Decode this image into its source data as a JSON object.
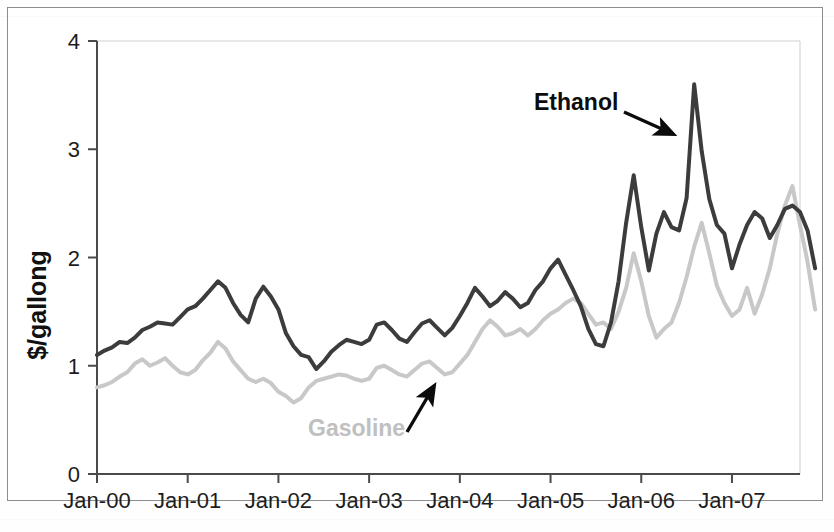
{
  "figure": {
    "background_color": "#ffffff",
    "border_color": "#8d8d8d"
  },
  "chart_data": {
    "type": "line",
    "title": "",
    "subtitle": "",
    "xlabel": "",
    "ylabel": "$/gallong",
    "xlim": [
      0,
      93
    ],
    "ylim": [
      0,
      4
    ],
    "grid": false,
    "legend_position": "inline-annotations",
    "x_tick_labels": [
      "Jan-00",
      "Jan-01",
      "Jan-02",
      "Jan-03",
      "Jan-04",
      "Jan-05",
      "Jan-06",
      "Jan-07"
    ],
    "x_tick_positions": [
      0,
      12,
      24,
      36,
      48,
      60,
      72,
      84
    ],
    "y_tick_labels": [
      "0",
      "1",
      "2",
      "3",
      "4"
    ],
    "y_tick_values": [
      0,
      1,
      2,
      3,
      4
    ],
    "annotations": [
      {
        "text": "Ethanol",
        "color": "#0c0c0c",
        "arrow": true,
        "arrow_direction": "down-right"
      },
      {
        "text": "Gasoline",
        "color": "#c0c0c0",
        "arrow": true,
        "arrow_direction": "up-right"
      }
    ],
    "series": [
      {
        "name": "Ethanol",
        "color": "#3c3c3c",
        "line_width": 4.0,
        "values": [
          1.1,
          1.14,
          1.17,
          1.22,
          1.21,
          1.26,
          1.33,
          1.36,
          1.4,
          1.39,
          1.38,
          1.45,
          1.52,
          1.55,
          1.62,
          1.7,
          1.78,
          1.72,
          1.58,
          1.47,
          1.4,
          1.62,
          1.73,
          1.64,
          1.52,
          1.3,
          1.18,
          1.1,
          1.08,
          0.97,
          1.04,
          1.13,
          1.19,
          1.24,
          1.22,
          1.2,
          1.24,
          1.38,
          1.4,
          1.33,
          1.25,
          1.22,
          1.31,
          1.39,
          1.42,
          1.35,
          1.28,
          1.35,
          1.46,
          1.58,
          1.72,
          1.64,
          1.55,
          1.6,
          1.68,
          1.62,
          1.54,
          1.58,
          1.7,
          1.78,
          1.9,
          1.98,
          1.84,
          1.7,
          1.55,
          1.34,
          1.2,
          1.18,
          1.4,
          1.78,
          2.32,
          2.76,
          2.28,
          1.88,
          2.22,
          2.42,
          2.28,
          2.25,
          2.55,
          3.6,
          2.98,
          2.54,
          2.3,
          2.22,
          1.9,
          2.12,
          2.3,
          2.42,
          2.36,
          2.18,
          2.3,
          2.45,
          2.48,
          2.42,
          2.25,
          1.9
        ]
      },
      {
        "name": "Gasoline",
        "color": "#c8c8c8",
        "line_width": 4.0,
        "values": [
          0.8,
          0.82,
          0.85,
          0.9,
          0.94,
          1.02,
          1.06,
          1.0,
          1.03,
          1.07,
          1.0,
          0.94,
          0.92,
          0.96,
          1.05,
          1.12,
          1.22,
          1.16,
          1.04,
          0.96,
          0.88,
          0.85,
          0.88,
          0.84,
          0.76,
          0.72,
          0.66,
          0.7,
          0.8,
          0.86,
          0.88,
          0.9,
          0.92,
          0.91,
          0.88,
          0.86,
          0.88,
          0.98,
          1.0,
          0.96,
          0.92,
          0.9,
          0.96,
          1.02,
          1.04,
          0.98,
          0.92,
          0.94,
          1.02,
          1.1,
          1.22,
          1.34,
          1.42,
          1.36,
          1.28,
          1.3,
          1.34,
          1.28,
          1.34,
          1.42,
          1.48,
          1.52,
          1.58,
          1.62,
          1.58,
          1.48,
          1.38,
          1.4,
          1.34,
          1.5,
          1.72,
          2.04,
          1.78,
          1.46,
          1.26,
          1.34,
          1.4,
          1.58,
          1.82,
          2.1,
          2.32,
          2.04,
          1.74,
          1.58,
          1.46,
          1.52,
          1.72,
          1.48,
          1.66,
          1.9,
          2.22,
          2.48,
          2.66,
          2.3,
          1.96,
          1.52
        ]
      }
    ]
  }
}
